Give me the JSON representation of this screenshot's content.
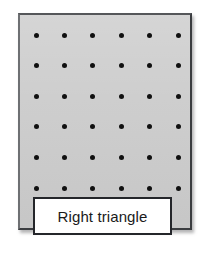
{
  "figure": {
    "name": "geoboard-figure",
    "canvas": {
      "width": 206,
      "height": 260,
      "background": "#ffffff"
    },
    "panel": {
      "name": "geoboard-panel",
      "fill": "#cdcdcd",
      "border_color": "#3b3d40",
      "x": 18,
      "y": 13,
      "width": 174,
      "height": 217
    },
    "dot_grid": {
      "rows": 6,
      "columns": 6,
      "total_dots": 36,
      "dot_color": "#101010",
      "dot_diameter": 5,
      "origin_x": 34,
      "origin_y": 33,
      "column_spacing": 28.4,
      "row_spacing": 30.6
    },
    "label": {
      "name": "shape-label",
      "text": "Right triangle",
      "background": "#ffffff",
      "border_color": "#24262a",
      "text_color": "#1a1a1a",
      "x": 33,
      "y": 197,
      "width": 139,
      "height": 38
    }
  }
}
